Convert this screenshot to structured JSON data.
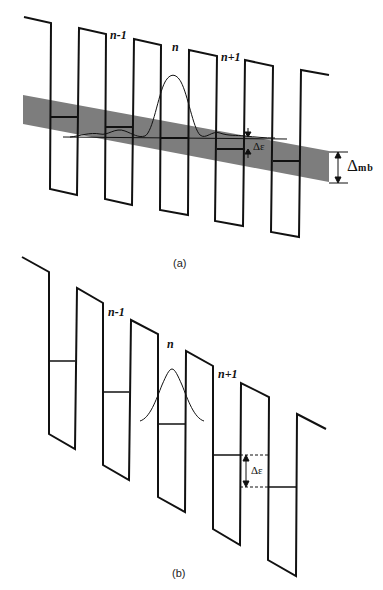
{
  "panels": [
    {
      "id": "a",
      "caption": "(a)",
      "labels": {
        "n_minus_1": "n-1",
        "n": "n",
        "n_plus_1": "n+1"
      },
      "delta_epsilon": "Δε",
      "delta_mb": "Δ",
      "delta_mb_sub": "mb",
      "band_color": "#7a7a7a"
    },
    {
      "id": "b",
      "caption": "(b)",
      "labels": {
        "n_minus_1": "n-1",
        "n": "n",
        "n_plus_1": "n+1"
      },
      "delta_epsilon": "Δε"
    }
  ],
  "colors": {
    "line": "#111111",
    "band": "#7d7d7d",
    "background": "#ffffff"
  }
}
